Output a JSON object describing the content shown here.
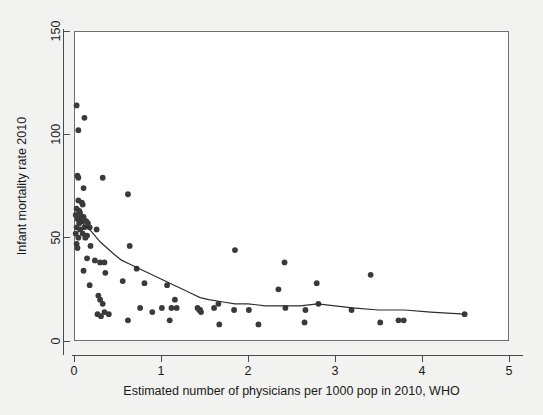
{
  "chart_data": {
    "type": "scatter",
    "title": "",
    "xlabel": "Estimated number of physicians per 1000 pop in 2010, WHO",
    "ylabel": "Infant mortality rate 2010",
    "xlim": [
      0,
      5
    ],
    "ylim": [
      0,
      150
    ],
    "xticks": [
      0,
      1,
      2,
      3,
      4,
      5
    ],
    "yticks": [
      0,
      50,
      100,
      150
    ],
    "xtick_labels": [
      "0",
      "1",
      "2",
      "3",
      "4",
      "5"
    ],
    "ytick_labels": [
      "0",
      "50",
      "100",
      "150"
    ],
    "grid": false,
    "legend": "none",
    "marker_color": "#3a3a3a",
    "line_color": "#2e2e2e",
    "plot_bg": "#ffffff",
    "figure_bg": "#f2f2f0",
    "series": [
      {
        "name": "Countries",
        "type": "scatter",
        "points": [
          [
            0.03,
            114
          ],
          [
            0.12,
            108
          ],
          [
            0.05,
            102
          ],
          [
            0.04,
            80
          ],
          [
            0.05,
            79
          ],
          [
            0.33,
            79
          ],
          [
            0.11,
            74
          ],
          [
            0.62,
            71
          ],
          [
            0.05,
            68
          ],
          [
            0.09,
            67
          ],
          [
            0.1,
            66
          ],
          [
            0.03,
            64
          ],
          [
            0.06,
            63
          ],
          [
            0.07,
            62
          ],
          [
            0.02,
            61
          ],
          [
            0.08,
            60
          ],
          [
            0.11,
            60
          ],
          [
            0.04,
            59
          ],
          [
            0.09,
            58
          ],
          [
            0.14,
            58
          ],
          [
            0.06,
            57
          ],
          [
            0.16,
            57
          ],
          [
            0.03,
            55
          ],
          [
            0.12,
            55
          ],
          [
            0.18,
            55
          ],
          [
            0.07,
            54
          ],
          [
            0.26,
            54
          ],
          [
            0.02,
            52
          ],
          [
            0.1,
            52
          ],
          [
            0.15,
            51
          ],
          [
            0.05,
            50
          ],
          [
            0.13,
            50
          ],
          [
            0.03,
            47
          ],
          [
            0.19,
            46
          ],
          [
            0.04,
            45
          ],
          [
            0.64,
            46
          ],
          [
            1.85,
            44
          ],
          [
            0.15,
            40
          ],
          [
            0.24,
            39
          ],
          [
            0.3,
            38
          ],
          [
            2.42,
            38
          ],
          [
            0.35,
            38
          ],
          [
            0.72,
            35
          ],
          [
            0.11,
            34
          ],
          [
            0.36,
            33
          ],
          [
            3.41,
            32
          ],
          [
            0.56,
            29
          ],
          [
            0.81,
            28
          ],
          [
            2.79,
            28
          ],
          [
            0.18,
            27
          ],
          [
            1.07,
            27
          ],
          [
            2.35,
            25
          ],
          [
            0.28,
            22
          ],
          [
            0.3,
            20
          ],
          [
            1.16,
            20
          ],
          [
            0.33,
            18
          ],
          [
            1.66,
            18
          ],
          [
            2.81,
            18
          ],
          [
            0.76,
            16
          ],
          [
            1.01,
            16
          ],
          [
            1.12,
            16
          ],
          [
            1.18,
            16
          ],
          [
            1.42,
            16
          ],
          [
            1.44,
            15
          ],
          [
            1.45,
            15
          ],
          [
            1.46,
            14
          ],
          [
            1.61,
            16
          ],
          [
            1.84,
            15
          ],
          [
            2.01,
            15
          ],
          [
            2.43,
            16
          ],
          [
            2.66,
            15
          ],
          [
            3.19,
            15
          ],
          [
            4.49,
            13
          ],
          [
            0.35,
            14
          ],
          [
            0.31,
            12
          ],
          [
            0.62,
            10
          ],
          [
            1.1,
            10
          ],
          [
            1.67,
            8
          ],
          [
            2.12,
            8
          ],
          [
            2.65,
            9
          ],
          [
            3.52,
            9
          ],
          [
            3.73,
            10
          ],
          [
            3.79,
            10
          ],
          [
            0.27,
            13
          ],
          [
            0.4,
            13
          ],
          [
            0.9,
            14
          ]
        ]
      },
      {
        "name": "Lowess smoother",
        "type": "line",
        "points": [
          [
            0.07,
            58
          ],
          [
            0.12,
            56
          ],
          [
            0.18,
            54
          ],
          [
            0.24,
            51
          ],
          [
            0.3,
            48
          ],
          [
            0.38,
            45
          ],
          [
            0.46,
            42
          ],
          [
            0.55,
            39
          ],
          [
            0.65,
            37
          ],
          [
            0.75,
            35
          ],
          [
            0.85,
            33
          ],
          [
            0.95,
            31
          ],
          [
            1.05,
            29
          ],
          [
            1.15,
            27
          ],
          [
            1.25,
            25
          ],
          [
            1.35,
            23
          ],
          [
            1.45,
            21
          ],
          [
            1.55,
            20
          ],
          [
            1.7,
            19
          ],
          [
            1.85,
            18
          ],
          [
            2.0,
            18
          ],
          [
            2.2,
            17
          ],
          [
            2.4,
            17
          ],
          [
            2.6,
            17
          ],
          [
            2.8,
            18
          ],
          [
            3.0,
            17
          ],
          [
            3.2,
            16
          ],
          [
            3.5,
            15
          ],
          [
            3.8,
            15
          ],
          [
            4.1,
            14
          ],
          [
            4.49,
            13
          ]
        ]
      }
    ]
  }
}
